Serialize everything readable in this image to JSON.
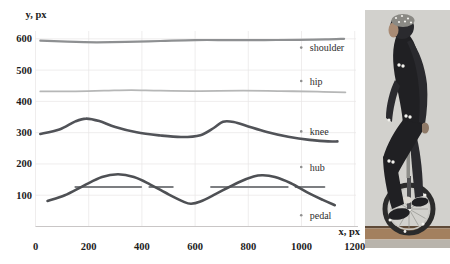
{
  "canvas": {
    "width": 450,
    "height": 264,
    "background": "#ffffff"
  },
  "chart_data": {
    "type": "line",
    "title": "",
    "xlabel": "x, px",
    "ylabel": "y, px",
    "xlim": [
      0,
      1260
    ],
    "ylim": [
      0,
      660
    ],
    "x_ticks": [
      0,
      200,
      400,
      600,
      800,
      1000,
      1200
    ],
    "y_ticks": [
      100,
      200,
      300,
      400,
      500,
      600
    ],
    "grid": true,
    "grid_color": "#e8e5e5",
    "axis_line_color": "#c9c6c6",
    "legend_position": "right-inside",
    "legend_marker_color": "#909090",
    "series": [
      {
        "name": "shoulder",
        "color": "#8e9092",
        "width": 2.2,
        "label_y": 572,
        "points": [
          [
            18,
            594
          ],
          [
            120,
            591
          ],
          [
            230,
            589
          ],
          [
            340,
            590
          ],
          [
            470,
            593
          ],
          [
            600,
            596
          ],
          [
            730,
            596
          ],
          [
            860,
            596
          ],
          [
            990,
            597
          ],
          [
            1090,
            598
          ],
          [
            1160,
            600
          ]
        ]
      },
      {
        "name": "hip",
        "color": "#b6b7b7",
        "width": 1.8,
        "label_y": 465,
        "points": [
          [
            18,
            432
          ],
          [
            150,
            432
          ],
          [
            260,
            434
          ],
          [
            360,
            436
          ],
          [
            470,
            434
          ],
          [
            620,
            433
          ],
          [
            780,
            434
          ],
          [
            920,
            433
          ],
          [
            1060,
            431
          ],
          [
            1165,
            429
          ]
        ]
      },
      {
        "name": "knee",
        "color": "#515358",
        "width": 2.6,
        "label_y": 304,
        "points": [
          [
            18,
            296
          ],
          [
            90,
            310
          ],
          [
            150,
            336
          ],
          [
            190,
            345
          ],
          [
            240,
            337
          ],
          [
            300,
            318
          ],
          [
            380,
            301
          ],
          [
            470,
            291
          ],
          [
            550,
            286
          ],
          [
            620,
            292
          ],
          [
            670,
            315
          ],
          [
            705,
            335
          ],
          [
            745,
            334
          ],
          [
            800,
            320
          ],
          [
            870,
            302
          ],
          [
            950,
            287
          ],
          [
            1030,
            277
          ],
          [
            1100,
            272
          ],
          [
            1135,
            272
          ]
        ]
      },
      {
        "name": "hub",
        "color": "#7c7e81",
        "width": 2.0,
        "label_y": 190,
        "style": "segments",
        "y": 126,
        "segments": [
          [
            150,
            397
          ],
          [
            428,
            516
          ],
          [
            660,
            948
          ],
          [
            978,
            1086
          ]
        ]
      },
      {
        "name": "pedal",
        "color": "#4e5054",
        "width": 2.6,
        "label_y": 36,
        "points": [
          [
            45,
            82
          ],
          [
            110,
            100
          ],
          [
            180,
            130
          ],
          [
            250,
            158
          ],
          [
            310,
            167
          ],
          [
            370,
            158
          ],
          [
            430,
            135
          ],
          [
            500,
            103
          ],
          [
            560,
            78
          ],
          [
            585,
            73
          ],
          [
            620,
            80
          ],
          [
            680,
            105
          ],
          [
            760,
            140
          ],
          [
            820,
            160
          ],
          [
            855,
            164
          ],
          [
            900,
            158
          ],
          [
            960,
            138
          ],
          [
            1020,
            110
          ],
          [
            1080,
            85
          ],
          [
            1125,
            68
          ]
        ]
      }
    ]
  },
  "photo": {
    "alt": "unicyclist-with-motion-capture-markers",
    "colors": {
      "wall": "#d2d1cd",
      "floor": "#a3805f",
      "floor_edge": "#5f4a38",
      "floor_lower": "#b9b4ac",
      "suit": "#202023",
      "suit2": "#2a2a2e",
      "skin": "#a98b74",
      "cap": "#8a8984",
      "marker": "#f3f2ee",
      "tire": "#2b2b2b",
      "rim": "#c7c6c2",
      "spoke": "#9a9a96",
      "post": "#8e8e8a",
      "fork": "#4f4f51",
      "hand": "#8f7a68",
      "sock": "#ddd9d2"
    }
  }
}
